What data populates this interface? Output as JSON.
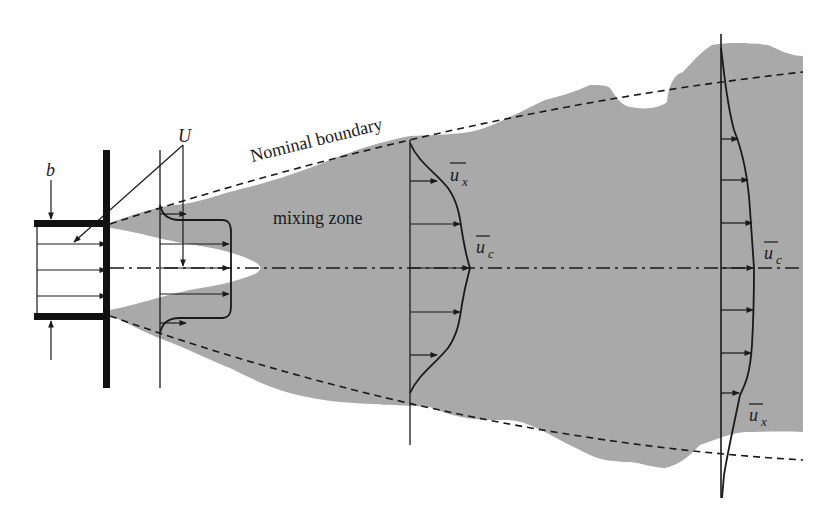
{
  "diagram": {
    "type": "turbulent plane jet velocity profiles",
    "labels": {
      "nominal_boundary": "Nominal boundary",
      "mixing_zone": "mixing zone",
      "velocity_U": "U",
      "width_b": "b",
      "mean_velocity_x_1": "u",
      "mean_velocity_x_1_sub": "x",
      "mean_velocity_c_1": "u",
      "mean_velocity_c_1_sub": "c",
      "mean_velocity_c_2": "u",
      "mean_velocity_c_2_sub": "c",
      "mean_velocity_x_2": "u",
      "mean_velocity_x_2_sub": "x"
    },
    "colors": {
      "mixing_region": "#a9a9a9",
      "lines": "#1a1a1a",
      "background": "#ffffff"
    },
    "sections": [
      {
        "name": "nozzle-exit",
        "x": 37,
        "profile": "uniform"
      },
      {
        "name": "potential-core",
        "x": 160,
        "profile": "top-hat with shear layers"
      },
      {
        "name": "developing",
        "x": 412,
        "profile": "gaussian"
      },
      {
        "name": "far-field",
        "x": 721,
        "profile": "wide gaussian"
      }
    ]
  }
}
